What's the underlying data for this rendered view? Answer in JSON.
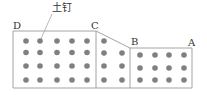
{
  "diagram": {
    "callout_label": "土钉",
    "points": {
      "D": "D",
      "C": "C",
      "B": "B",
      "A": "A"
    },
    "colors": {
      "outline": "#9a9a9a",
      "nail": "#808080"
    },
    "sections": [
      {
        "name": "D-C flat section",
        "columns": 5,
        "rows": 4
      },
      {
        "name": "C-B slope section",
        "columns": 2,
        "rows": 4
      },
      {
        "name": "B-A flat section",
        "columns": 4,
        "rows": 3
      }
    ]
  }
}
